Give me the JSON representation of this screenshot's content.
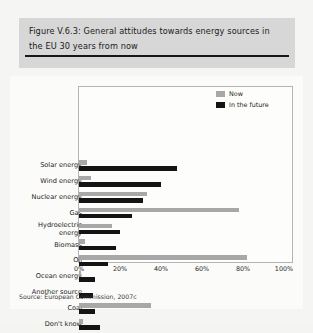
{
  "figure": {
    "title": "Figure V.6.3: General attitudes towards energy sources in the EU 30 years from now",
    "source": "Source: European Commission, 2007c"
  },
  "legend": {
    "position": "top-right",
    "items": [
      {
        "label": "Now",
        "color": "#a8a8a8"
      },
      {
        "label": "In the future",
        "color": "#141414"
      }
    ]
  },
  "axis": {
    "ticks": [
      "0%",
      "20%",
      "40%",
      "60%",
      "80%",
      "100%"
    ]
  },
  "chart_data": {
    "type": "bar",
    "orientation": "horizontal",
    "title": "Figure V.6.3: General attitudes towards energy sources in the EU 30 years from now",
    "xlabel": "",
    "ylabel": "",
    "xlim": [
      0,
      100
    ],
    "xticks": [
      0,
      20,
      40,
      60,
      80,
      100
    ],
    "xtick_labels": [
      "0%",
      "20%",
      "40%",
      "60%",
      "80%",
      "100%"
    ],
    "grid": false,
    "legend_position": "top-right",
    "categories": [
      "Solar energy",
      "Wind energy",
      "Nuclear energy",
      "Gas",
      "Hydroelectric energy",
      "Biomass",
      "Oil",
      "Ocean energy",
      "Another source",
      "Coal",
      "Don't know"
    ],
    "series": [
      {
        "name": "Now",
        "color": "#a8a8a8",
        "values": [
          4,
          6,
          33,
          78,
          16,
          3,
          82,
          1,
          0,
          35,
          2
        ]
      },
      {
        "name": "In the future",
        "color": "#141414",
        "values": [
          48,
          40,
          31,
          26,
          20,
          18,
          14,
          8,
          7,
          8,
          10
        ]
      }
    ],
    "annotations": [
      "Source: European Commission, 2007c"
    ]
  }
}
